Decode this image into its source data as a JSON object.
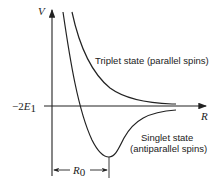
{
  "diagram": {
    "type": "potential-energy-curves",
    "axes": {
      "y_label": "V",
      "x_label": "R",
      "y_tick_label_prefix": "−2",
      "y_tick_label_var": "E",
      "y_tick_label_sub": "1"
    },
    "curves": [
      {
        "name": "triplet",
        "label": "Triplet state (parallel spins)"
      },
      {
        "name": "singlet",
        "label_line1": "Singlet state",
        "label_line2": "(antiparallel spins)"
      }
    ],
    "annotation": {
      "dimension_label_var": "R",
      "dimension_label_sub": "0"
    },
    "colors": {
      "line": "#222222",
      "background": "#ffffff"
    }
  }
}
